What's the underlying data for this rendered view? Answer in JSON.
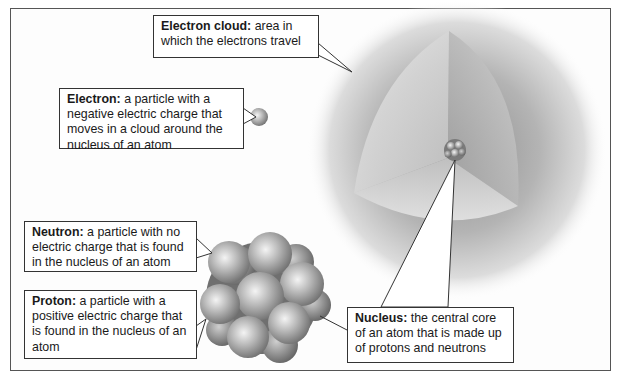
{
  "diagram": {
    "labels": {
      "electron_cloud": {
        "term": "Electron cloud:",
        "definition": " area in which the electrons travel"
      },
      "electron": {
        "term": "Electron:",
        "definition": " a particle with a negative electric charge that moves in a cloud around the nucleus of an atom"
      },
      "neutron": {
        "term": "Neutron:",
        "definition": " a particle with no electric charge that is found in the nucleus of an atom"
      },
      "proton": {
        "term": "Proton:",
        "definition": " a particle with a positive electric charge that is found in the nucleus of an atom"
      },
      "nucleus": {
        "term": "Nucleus:",
        "definition": " the central core of an atom that is made up of protons and neutrons"
      }
    },
    "colors": {
      "frame": "#555555",
      "cloud_outer": "#ffffff",
      "cloud_inner": "#9a9a9a",
      "particle": "#a8a8a8",
      "callout_border": "#333333"
    }
  }
}
